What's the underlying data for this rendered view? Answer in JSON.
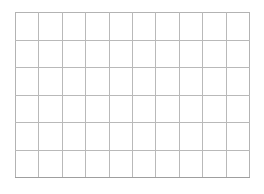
{
  "canvas": {
    "width": 264,
    "height": 194,
    "background_color": "#ffffff"
  },
  "grid": {
    "name": "blank-grid",
    "columns": 10,
    "rows": 6,
    "total_cells": 60,
    "line_color": "#b9b9b9",
    "cell_fill_color": "#ffffff",
    "line_width_px": 1,
    "bounds": {
      "left": 15,
      "top": 12,
      "right": 250,
      "bottom": 177,
      "width": 235,
      "height": 165
    },
    "cell_size": {
      "width": 23.5,
      "height": 27.5
    },
    "cells": [
      [
        "",
        "",
        "",
        "",
        "",
        "",
        "",
        "",
        "",
        ""
      ],
      [
        "",
        "",
        "",
        "",
        "",
        "",
        "",
        "",
        "",
        ""
      ],
      [
        "",
        "",
        "",
        "",
        "",
        "",
        "",
        "",
        "",
        ""
      ],
      [
        "",
        "",
        "",
        "",
        "",
        "",
        "",
        "",
        "",
        ""
      ],
      [
        "",
        "",
        "",
        "",
        "",
        "",
        "",
        "",
        "",
        ""
      ],
      [
        "",
        "",
        "",
        "",
        "",
        "",
        "",
        "",
        "",
        ""
      ]
    ]
  }
}
